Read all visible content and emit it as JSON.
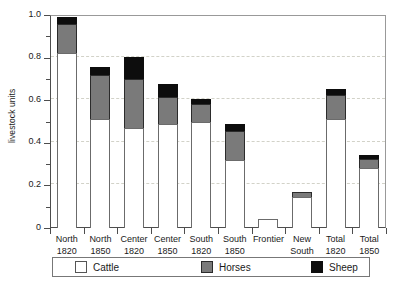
{
  "chart_data": {
    "type": "bar",
    "title": "",
    "subtitle": "",
    "xlabel": "",
    "ylabel": "livestock units",
    "ylim": [
      0,
      1.0
    ],
    "ytick_values": [
      0,
      0.2,
      0.4,
      0.6,
      0.8,
      1.0
    ],
    "ytick_labels": [
      "0",
      "0.2",
      "0.4",
      "0.6",
      "0.8",
      "1.0"
    ],
    "yminor_values": [
      0.1,
      0.3,
      0.5,
      0.7,
      0.9
    ],
    "grid": "horizontal-dashed",
    "stacked": true,
    "legend_position": "bottom",
    "categories": [
      {
        "line1": "North",
        "line2": "1820"
      },
      {
        "line1": "North",
        "line2": "1850"
      },
      {
        "line1": "Center",
        "line2": "1820"
      },
      {
        "line1": "Center",
        "line2": "1850"
      },
      {
        "line1": "South",
        "line2": "1820"
      },
      {
        "line1": "South",
        "line2": "1850"
      },
      {
        "line1": "Frontier",
        "line2": ""
      },
      {
        "line1": "New",
        "line2": "South"
      },
      {
        "line1": "Total",
        "line2": "1820"
      },
      {
        "line1": "Total",
        "line2": "1850"
      }
    ],
    "series": [
      {
        "name": "Cattle",
        "color": "#ffffff",
        "values": [
          0.82,
          0.51,
          0.47,
          0.49,
          0.5,
          0.32,
          0.04,
          0.145,
          0.51,
          0.28
        ]
      },
      {
        "name": "Horses",
        "color": "#7a7a7a",
        "values": [
          0.14,
          0.21,
          0.23,
          0.125,
          0.08,
          0.135,
          0.0,
          0.025,
          0.115,
          0.045
        ]
      },
      {
        "name": "Sheep",
        "color": "#0d0d0d",
        "values": [
          0.03,
          0.035,
          0.105,
          0.06,
          0.025,
          0.035,
          0.0,
          0.0,
          0.03,
          0.02
        ]
      }
    ],
    "totals": [
      0.99,
      0.755,
      0.805,
      0.675,
      0.605,
      0.49,
      0.04,
      0.17,
      0.655,
      0.345
    ]
  },
  "legend": {
    "items": [
      {
        "label": "Cattle"
      },
      {
        "label": "Horses"
      },
      {
        "label": "Sheep"
      }
    ]
  }
}
